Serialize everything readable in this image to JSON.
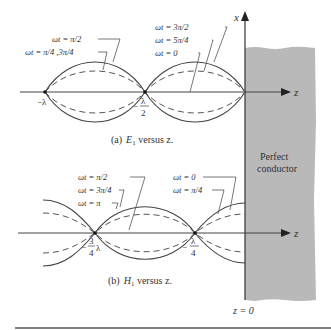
{
  "figure": {
    "axis_x_label": "x",
    "axis_z_label": "z",
    "conductor_label_line1": "Perfect",
    "conductor_label_line2": "conductor",
    "boundary_label": "z = 0",
    "conductor_color": "#b9b9b9"
  },
  "panel_a": {
    "caption_prefix": "(a)",
    "caption_var": "E",
    "caption_sub": "1",
    "caption_suffix": " versus z.",
    "legend_left": [
      "ωt = π/2",
      "ωt = π/4 ,3π/4"
    ],
    "legend_right": [
      "ωt = 3π/2",
      "ωt = 5π/4",
      "ωt = 0"
    ],
    "node_labels": [
      "−λ",
      "λ",
      "2"
    ],
    "node_minus": "−"
  },
  "panel_b": {
    "caption_prefix": "(b)",
    "caption_var": "H",
    "caption_sub": "1",
    "caption_suffix": " versus z.",
    "legend_left": [
      "ωt = π/2",
      "ωt = 3π/4",
      "ωt = π"
    ],
    "legend_right": [
      "ωt = 0",
      "ωt = π/4"
    ],
    "node1_num": "3",
    "node1_den": "4",
    "node1_lambda": "λ",
    "node2_num": "λ",
    "node2_den": "4",
    "node_minus": "−"
  }
}
